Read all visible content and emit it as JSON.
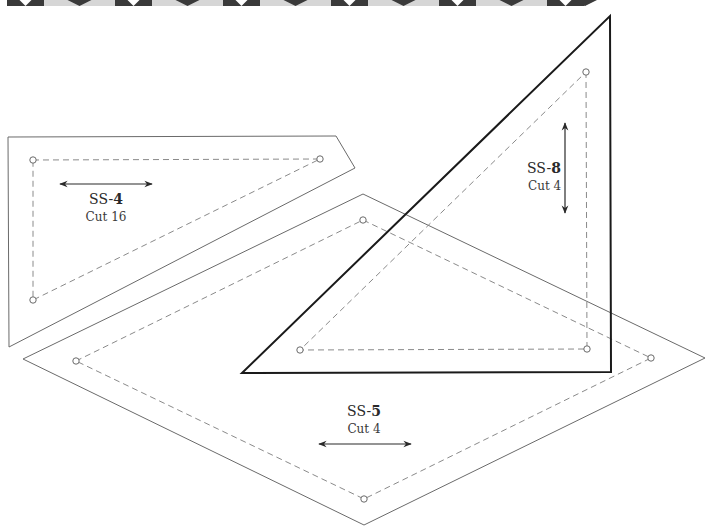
{
  "border_strip": {
    "x_start": 7,
    "x_end": 586,
    "height": 6,
    "dark_width": 37,
    "light_width": 71,
    "dark_color": "#3a3a3a",
    "light_color": "#d6d6d6",
    "icon": "down-triangle-icon"
  },
  "pieces": [
    {
      "id": "SS-4",
      "prefix": "SS-",
      "number": "4",
      "cut": "Cut 16",
      "grain": "horizontal"
    },
    {
      "id": "SS-5",
      "prefix": "SS-",
      "number": "5",
      "cut": "Cut 4",
      "grain": "horizontal"
    },
    {
      "id": "SS-8",
      "prefix": "SS-",
      "number": "8",
      "cut": "Cut 4",
      "grain": "vertical"
    }
  ],
  "colors": {
    "outline": "#6a6a6a",
    "outline_bold": "#1a1a1a",
    "seam": "#8a8a8a"
  }
}
